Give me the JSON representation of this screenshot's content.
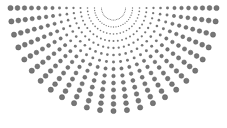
{
  "figure": {
    "width": 227,
    "height": 128,
    "background_color": "#ffffff",
    "title": "",
    "subtitle": ""
  },
  "chart_data": {
    "type": "scatter",
    "title": "",
    "subtitle": "",
    "xlabel": "",
    "ylabel": "",
    "xlim": [
      0,
      227
    ],
    "ylim": [
      0,
      128
    ],
    "grid": false,
    "axes_visible": false,
    "tick_labels_x": [],
    "tick_labels_y": [],
    "legend": {
      "visible": false,
      "position": "none",
      "entries": []
    },
    "annotations": [],
    "marker": {
      "shape": "circle",
      "color": "#6b6b6b",
      "edge_color": "#565656",
      "min_diameter_px": 1.0,
      "max_diameter_px": 5.2,
      "opacity": 0.92
    },
    "geometry": {
      "apex_x": 113.5,
      "apex_y": 8.0,
      "ray_count": 25,
      "angle_start_deg": 0,
      "angle_end_deg": 180,
      "dots_per_ray": 14,
      "radius_min_px": 12,
      "radius_max_px": 103,
      "radius_spacing": "linear",
      "size_growth": "linear-with-radius",
      "horizontal_squash": 1.0
    },
    "series": [
      {
        "name": "radial-dots",
        "color": "#6b6b6b",
        "point_count": 350,
        "note": "Points generated as polar grid (ray angle x radius step) around the apex; sizes scale with radius."
      }
    ]
  }
}
